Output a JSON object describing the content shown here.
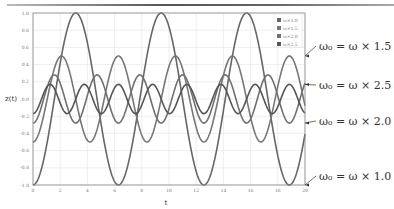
{
  "chart_data": {
    "type": "line",
    "title": "",
    "xlabel": "t",
    "ylabel": "z(t)",
    "xlim": [
      0,
      20
    ],
    "ylim": [
      -1.0,
      1.0
    ],
    "x_ticks": [
      "0",
      "2",
      "4",
      "6",
      "8",
      "10",
      "12",
      "14",
      "16",
      "18",
      "20"
    ],
    "y_ticks": [
      "1.0",
      "0.8",
      "0.6",
      "0.4",
      "0.2",
      "0.0",
      "-0.2",
      "-0.4",
      "-0.6",
      "-0.8",
      "-1.0"
    ],
    "grid": true,
    "legend_position": "upper right",
    "series": [
      {
        "name": "ω×1.0",
        "amplitude": 1.0,
        "freq_multiplier": 1.0,
        "formula": "-1.0*cos(1.0*t)",
        "color": "#666666"
      },
      {
        "name": "ω×1.5",
        "amplitude": 0.5,
        "freq_multiplier": 1.5,
        "formula": "-0.5*cos(1.5*t)",
        "color": "#777777"
      },
      {
        "name": "ω×2.0",
        "amplitude": 0.28,
        "freq_multiplier": 2.0,
        "formula": "-0.28*cos(2.0*t)",
        "color": "#707070"
      },
      {
        "name": "ω×2.5",
        "amplitude": 0.17,
        "freq_multiplier": 2.5,
        "formula": "-0.17*cos(2.5*t)",
        "color": "#555555"
      }
    ],
    "annotations": [
      {
        "text": "ω₀ = ω × 1.5",
        "points_to": "ω×1.5"
      },
      {
        "text": "ω₀ = ω × 2.5",
        "points_to": "ω×2.5"
      },
      {
        "text": "ω₀ = ω × 2.0",
        "points_to": "ω×2.0"
      },
      {
        "text": "ω₀ = ω × 1.0",
        "points_to": "ω×1.0"
      }
    ]
  }
}
